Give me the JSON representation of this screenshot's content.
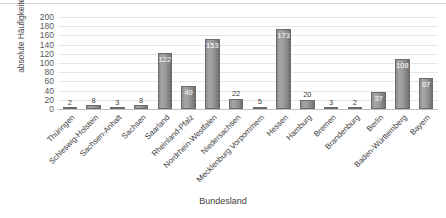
{
  "chart_data": {
    "type": "bar",
    "title": "",
    "xlabel": "Bundesland",
    "ylabel": "absolute Häufigkeiten",
    "ylim": [
      0,
      200
    ],
    "yticks": [
      0,
      20,
      40,
      60,
      80,
      100,
      120,
      140,
      160,
      180,
      200
    ],
    "grid": true,
    "legend": false,
    "categories": [
      "Thüringen",
      "Schleswig-Holstein",
      "Sachsen-Anhalt",
      "Sachsen",
      "Saarland",
      "Rheinland-Pfalz",
      "Nordrhein-Westfalen",
      "Niedersachsen",
      "Mecklenburg Vorpommern",
      "Hessen",
      "Hamburg",
      "Bremen",
      "Brandenburg",
      "Berlin",
      "Baden-Württemberg",
      "Bayern"
    ],
    "values": [
      2,
      8,
      3,
      8,
      122,
      49,
      153,
      22,
      5,
      173,
      20,
      3,
      2,
      37,
      108,
      67
    ],
    "bar_color": "#8c8c8c"
  }
}
